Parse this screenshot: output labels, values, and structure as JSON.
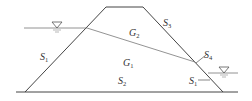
{
  "diagram": {
    "type": "dam cross-section",
    "colors": {
      "line": "#444444",
      "water": "#777777",
      "text": "#333333"
    },
    "labels": {
      "S1_left": {
        "main": "S",
        "sub": "1"
      },
      "S3": {
        "main": "S",
        "sub": "3"
      },
      "G2": {
        "main": "G",
        "sub": "2"
      },
      "G1": {
        "main": "G",
        "sub": "1"
      },
      "S2": {
        "main": "S",
        "sub": "2"
      },
      "S4": {
        "main": "S",
        "sub": "4"
      },
      "S1_right": {
        "main": "S",
        "sub": "1"
      }
    },
    "water_levels": [
      {
        "side": "upstream",
        "symbol": "water-level-triangle"
      },
      {
        "side": "downstream",
        "symbol": "water-level-triangle"
      }
    ]
  }
}
